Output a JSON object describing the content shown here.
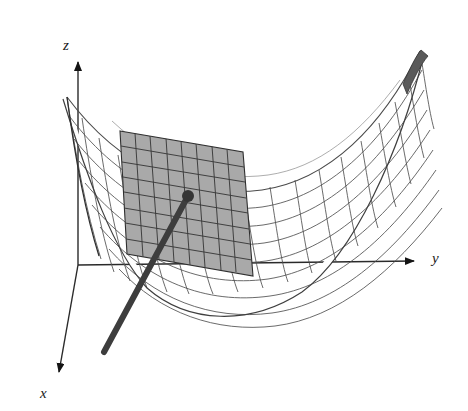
{
  "figure": {
    "title": "",
    "background_color": "#ffffff",
    "axes": {
      "z": {
        "label": "z",
        "icon": "arrow-up-icon",
        "origin": [
          78,
          265
        ],
        "tip": [
          78,
          58
        ],
        "direction": "up"
      },
      "y": {
        "label": "y",
        "icon": "arrow-right-icon",
        "origin": [
          78,
          265
        ],
        "tip": [
          418,
          261
        ],
        "direction": "right"
      },
      "x": {
        "label": "x",
        "icon": "arrow-down-left-icon",
        "origin": [
          78,
          265
        ],
        "tip": [
          56,
          379
        ],
        "direction": "down-left"
      }
    },
    "surface": {
      "name": "mesh-surface",
      "kind": "paraboloid-mesh",
      "fill_color": "#fdfdfd",
      "line_color": "#4a4a4a",
      "u_divisions": 18,
      "v_divisions": 11
    },
    "tangent_plane": {
      "name": "tangent-plane",
      "fill_color": "#a9a9a9",
      "line_color": "#3a3a3a",
      "grid_rows": 8,
      "grid_cols": 8,
      "corners": [
        [
          120,
          131
        ],
        [
          243,
          152
        ],
        [
          253,
          276
        ],
        [
          127,
          254
        ]
      ]
    },
    "normal_vector": {
      "name": "normal-vector",
      "color": "#3d3d3d",
      "tail_point": [
        188,
        196
      ],
      "head_point": [
        104,
        352
      ],
      "dot_radius": 6,
      "line_width": 6
    },
    "colors": {
      "ink": "#1a1a1a",
      "surface_line": "#4a4a4a",
      "plane_fill": "#a9a9a9",
      "plane_line": "#3a3a3a",
      "vector": "#3d3d3d",
      "background": "#ffffff"
    }
  }
}
